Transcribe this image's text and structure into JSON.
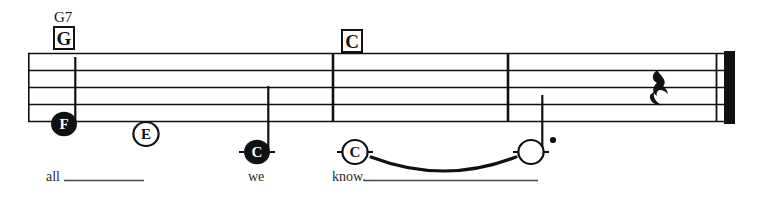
{
  "sheet": {
    "type": "music-notation-staff",
    "background_color": "#ffffff",
    "ink_color": "#111111",
    "staff": {
      "line_count": 5,
      "left_x": 28,
      "right_x": 735,
      "top_y": 53,
      "bottom_y": 122
    },
    "chords": [
      {
        "extension": "G7",
        "symbol": "G",
        "x": 53,
        "y": 10
      },
      {
        "extension": "",
        "symbol": "C",
        "x": 341,
        "y": 30
      }
    ],
    "barlines": [
      {
        "x": 333,
        "type": "single"
      },
      {
        "x": 508,
        "type": "single"
      },
      {
        "x": 717,
        "type": "thin-thick-final"
      }
    ],
    "notes": [
      {
        "letter": "F",
        "head": "filled",
        "x": 64,
        "y": 124,
        "stem": "up",
        "ledger": false,
        "dotted": false,
        "lyric": "all"
      },
      {
        "letter": "E",
        "head": "open",
        "x": 146,
        "y": 134,
        "stem": "none",
        "ledger": false,
        "dotted": false,
        "lyric": ""
      },
      {
        "letter": "C",
        "head": "filled",
        "x": 257,
        "y": 152,
        "stem": "up",
        "ledger": true,
        "dotted": false,
        "lyric": "we"
      },
      {
        "letter": "C",
        "head": "open",
        "x": 355,
        "y": 152,
        "stem": "none",
        "ledger": true,
        "dotted": false,
        "lyric": "know."
      },
      {
        "letter": "",
        "head": "open",
        "x": 531,
        "y": 152,
        "stem": "up",
        "ledger": true,
        "dotted": true,
        "lyric": ""
      }
    ],
    "rests": [
      {
        "type": "quarter-rest",
        "x": 661,
        "y": 87
      }
    ],
    "slur": {
      "from_x": 371,
      "to_x": 516,
      "peak_y": 178,
      "anchor_y": 156
    },
    "lyrics": [
      {
        "text": "all",
        "x": 46,
        "y": 176,
        "extender_width": 68
      },
      {
        "text": "we",
        "x": 248,
        "y": 176,
        "extender_width": 0
      },
      {
        "text": "know.",
        "x": 332,
        "y": 176,
        "extender_width": 205
      }
    ]
  }
}
